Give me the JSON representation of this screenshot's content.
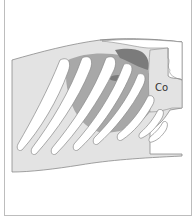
{
  "figure": {
    "labels": [
      {
        "id": "co",
        "text": "Co"
      }
    ]
  },
  "colors": {
    "body": "#e3e3e3",
    "outline": "#8a8a8a",
    "organ_mid": "#a8a8a8",
    "organ_dark": "#7b7b7b",
    "rib": "#ffffff"
  }
}
